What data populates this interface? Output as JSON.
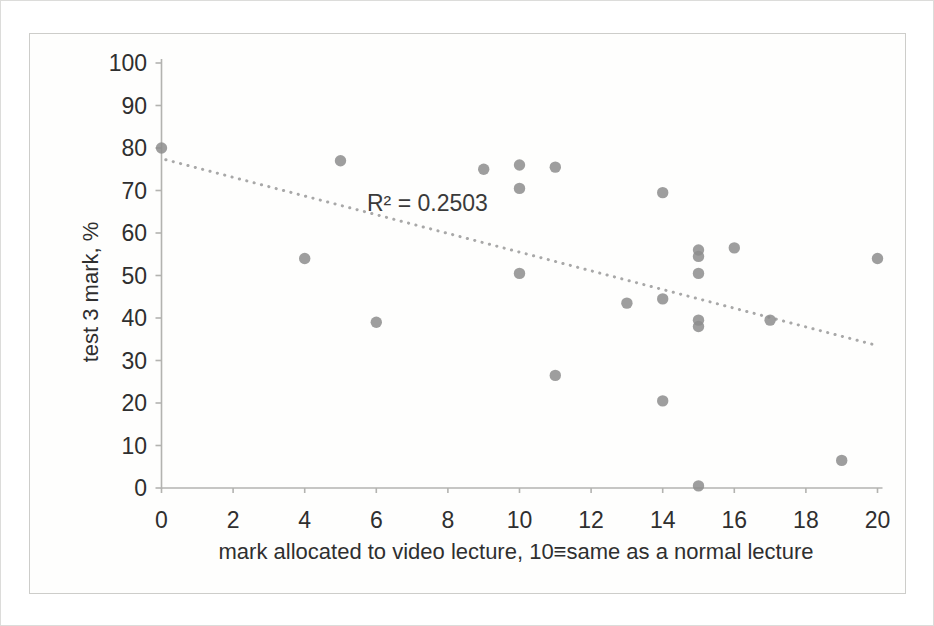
{
  "chart_data": {
    "type": "scatter",
    "title": "",
    "xlabel": "mark allocated to video lecture, 10≡same as a normal lecture",
    "ylabel": "test 3 mark, %",
    "annotation": "R² = 0.2503",
    "xlim": [
      0,
      20
    ],
    "ylim": [
      0,
      100
    ],
    "x_ticks": [
      0,
      2,
      4,
      6,
      8,
      10,
      12,
      14,
      16,
      18,
      20
    ],
    "y_ticks": [
      0,
      10,
      20,
      30,
      40,
      50,
      60,
      70,
      80,
      90,
      100
    ],
    "grid": false,
    "legend": "none",
    "points": [
      [
        0,
        80
      ],
      [
        4,
        54
      ],
      [
        5,
        77
      ],
      [
        6,
        39
      ],
      [
        9,
        75
      ],
      [
        10,
        76
      ],
      [
        10,
        70.5
      ],
      [
        10,
        50.5
      ],
      [
        11,
        75.5
      ],
      [
        11,
        26.5
      ],
      [
        13,
        43.5
      ],
      [
        14,
        69.5
      ],
      [
        14,
        44.5
      ],
      [
        14,
        20.5
      ],
      [
        15,
        56
      ],
      [
        15,
        54.5
      ],
      [
        15,
        50.5
      ],
      [
        15,
        39.5
      ],
      [
        15,
        38
      ],
      [
        15,
        0.5
      ],
      [
        16,
        56.5
      ],
      [
        17,
        39.5
      ],
      [
        19,
        6.5
      ],
      [
        20,
        54
      ]
    ],
    "trendline": {
      "type": "linear",
      "style": "dotted",
      "intercept": 77.5,
      "slope": -2.2,
      "r_squared": 0.2503
    },
    "colors": {
      "point": "#8d8d8d",
      "trendline": "#a8a8a8",
      "axis": "#b3b3b0",
      "text": "#2f2f2f",
      "frame_border": "#cdcdca",
      "background": "#fefefd"
    }
  }
}
